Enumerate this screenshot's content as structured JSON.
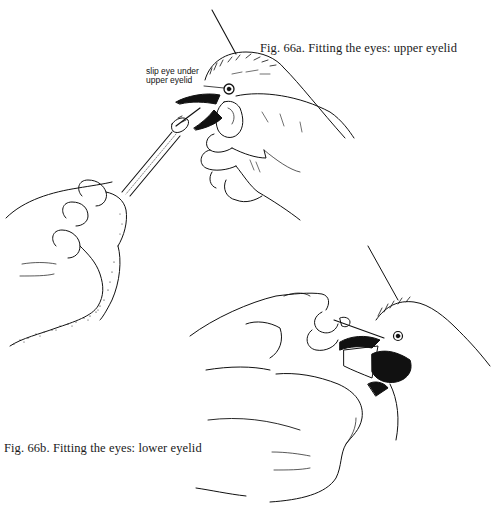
{
  "figures": [
    {
      "id_label": "Fig. 66a.",
      "caption": "Fig. 66a. Fitting the eyes: upper eyelid",
      "subject": "Hand holding bird head while another hand inserts eye with tool under upper eyelid",
      "callouts": [
        {
          "line1": "slip eye under",
          "line2": "upper eyelid"
        }
      ]
    },
    {
      "id_label": "Fig. 66b.",
      "caption": "Fig. 66b. Fitting the eyes: lower eyelid",
      "subject": "Hands holding bird head and inserting eye under lower eyelid"
    }
  ],
  "colors": {
    "background": "#ffffff",
    "ink": "#111111"
  }
}
